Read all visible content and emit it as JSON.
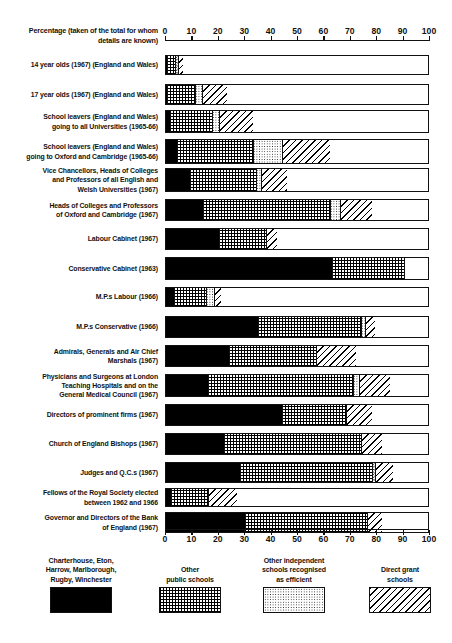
{
  "chart_data": {
    "type": "bar",
    "orientation": "horizontal",
    "stacked": true,
    "title": "",
    "xlabel": "Percentage (taken of the total for whom details are known)",
    "ylabel": "",
    "xlim": [
      0,
      100
    ],
    "grid": false,
    "legend_position": "bottom",
    "tick_labels": [
      "0",
      "10",
      "20",
      "30",
      "40",
      "50",
      "60",
      "70",
      "80",
      "90",
      "100"
    ],
    "tick_values": [
      0,
      10,
      20,
      30,
      40,
      50,
      60,
      70,
      80,
      90,
      100
    ],
    "series": [
      {
        "name": "Charterhouse, Eton, Harrow, Marlborough, Rugby, Winchester",
        "pattern": "solid-black",
        "values": [
          0.5,
          0.5,
          1.5,
          4.0,
          9.0,
          14.0,
          20.0,
          63.0,
          3.0,
          35.0,
          24.0,
          16.0,
          44.0,
          22.0,
          28.0,
          2.0,
          30.0
        ]
      },
      {
        "name": "Other public schools",
        "pattern": "grid",
        "values": [
          3.0,
          10.5,
          16.0,
          29.0,
          25.0,
          48.0,
          18.0,
          27.0,
          12.0,
          39.0,
          33.0,
          55.0,
          24.0,
          52.0,
          50.0,
          14.0,
          46.0
        ]
      },
      {
        "name": "Other independent schools recognised as efficient",
        "pattern": "stipple",
        "values": [
          1.0,
          2.5,
          2.5,
          11.0,
          2.0,
          4.0,
          0.0,
          0.0,
          3.0,
          1.5,
          0.0,
          2.0,
          0.0,
          0.0,
          1.0,
          0.0,
          0.0
        ]
      },
      {
        "name": "Direct grant schools",
        "pattern": "diagonal-hatch",
        "values": [
          2.0,
          9.5,
          13.0,
          18.0,
          10.0,
          12.0,
          4.0,
          0.0,
          3.0,
          3.5,
          15.0,
          12.0,
          10.0,
          8.0,
          7.0,
          11.0,
          6.0
        ]
      }
    ],
    "categories": [
      "14 year olds (1967) (England and Wales)",
      "17 year olds (1967) (England and Wales)",
      "School leavers (England and Wales) going to all Universities (1965-66)",
      "School leavers (England and Wales) going to Oxford and Cambridge (1965-66)",
      "Vice Chancellors, Heads of Colleges and Professors of all English and Welsh Universities (1967)",
      "Heads of Colleges and Professors of Oxford and Cambridge (1967)",
      "Labour Cabinet (1967)",
      "Conservative Cabinet (1963)",
      "M.P.s Labour (1966)",
      "M.P.s Conservative (1966)",
      "Admirals, Generals and Air Chief Marshals (1967)",
      "Physicians and Surgeons at London Teaching Hospitals and on the General Medical Council (1967)",
      "Directors of prominent firms (1967)",
      "Church of England Bishops (1967)",
      "Judges and Q.C.s (1967)",
      "Fellows of the Royal Society elected between 1962 and 1966",
      "Governor and Directors of the Bank of England (1967)"
    ]
  },
  "axis_caption": "Percentage (taken of the total for whom details are known)",
  "rows": [
    {
      "label_lines": [
        "14 year olds (1967) (England and Wales)"
      ],
      "segments": [
        0.5,
        3.0,
        1.0,
        2.0
      ]
    },
    {
      "label_lines": [
        "17 year olds (1967) (England and Wales)"
      ],
      "segments": [
        0.5,
        10.5,
        2.5,
        9.5
      ]
    },
    {
      "label_lines": [
        "School leavers (England and Wales)",
        "going to all Universities (1965-66)"
      ],
      "segments": [
        1.5,
        16.0,
        2.5,
        13.0
      ]
    },
    {
      "label_lines": [
        "School leavers (England and Wales)",
        "going to Oxford and Cambridge (1965-66)"
      ],
      "segments": [
        4.0,
        29.0,
        11.0,
        18.0
      ]
    },
    {
      "label_lines": [
        "Vice Chancellors, Heads of Colleges",
        "and Professors of all English and",
        "Welsh Universities  (1967)"
      ],
      "segments": [
        9.0,
        25.0,
        2.0,
        10.0
      ]
    },
    {
      "label_lines": [
        "Heads of Colleges and Professors",
        "of Oxford and Cambridge (1967)"
      ],
      "segments": [
        14.0,
        48.0,
        4.0,
        12.0
      ]
    },
    {
      "label_lines": [
        "Labour Cabinet (1967)"
      ],
      "segments": [
        20.0,
        18.0,
        0.0,
        4.0
      ]
    },
    {
      "label_lines": [
        "Conservative Cabinet (1963)"
      ],
      "segments": [
        63.0,
        27.0,
        0.0,
        0.0
      ]
    },
    {
      "label_lines": [
        "M.P.s Labour (1966)"
      ],
      "segments": [
        3.0,
        12.0,
        3.0,
        3.0
      ]
    },
    {
      "label_lines": [
        "M.P.s Conservative (1966)"
      ],
      "segments": [
        35.0,
        39.0,
        1.5,
        3.5
      ]
    },
    {
      "label_lines": [
        "Admirals, Generals and Air Chief",
        "Marshals (1967)"
      ],
      "segments": [
        24.0,
        33.0,
        0.0,
        15.0
      ]
    },
    {
      "label_lines": [
        "Physicians and Surgeons at London",
        "Teaching Hospitals and on the",
        "General Medical Council (1967)"
      ],
      "segments": [
        16.0,
        55.0,
        2.0,
        12.0
      ]
    },
    {
      "label_lines": [
        "Directors of prominent firms (1967)"
      ],
      "segments": [
        44.0,
        24.0,
        0.0,
        10.0
      ]
    },
    {
      "label_lines": [
        "Church of England Bishops (1967)"
      ],
      "segments": [
        22.0,
        52.0,
        0.0,
        8.0
      ]
    },
    {
      "label_lines": [
        "Judges and Q.C.s (1967)"
      ],
      "segments": [
        28.0,
        50.0,
        1.0,
        7.0
      ]
    },
    {
      "label_lines": [
        "Fellows of the Royal Society elected",
        "between 1962 and 1966"
      ],
      "segments": [
        2.0,
        14.0,
        0.0,
        11.0
      ]
    },
    {
      "label_lines": [
        "Governor and Directors of the Bank",
        "of England (1967)"
      ],
      "segments": [
        30.0,
        46.0,
        0.0,
        6.0
      ]
    }
  ],
  "legend": [
    {
      "lines": [
        "Charterhouse, Eton,",
        "Harrow, Marlborough,",
        "Rugby, Winchester"
      ],
      "pattern": "p-clarendon"
    },
    {
      "lines": [
        "Other",
        "public schools"
      ],
      "pattern": "p-public"
    },
    {
      "lines": [
        "Other independent",
        "schools recognised",
        "as efficient"
      ],
      "pattern": "p-indep"
    },
    {
      "lines": [
        "Direct grant",
        "schools"
      ],
      "pattern": "p-grant"
    }
  ]
}
